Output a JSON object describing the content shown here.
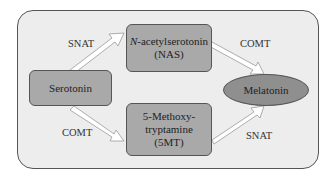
{
  "diagram": {
    "nodes": {
      "serotonin": {
        "label": "Serotonin"
      },
      "nas": {
        "label_italic": "N",
        "label_rest": "-acetylserotonin",
        "label_abbrev": "(NAS)"
      },
      "fivemt": {
        "line1": "5-Methoxy-",
        "line2": "tryptamine",
        "line3": "(5MT)"
      },
      "melatonin": {
        "label": "Melatonin"
      }
    },
    "edges": [
      {
        "from": "Serotonin",
        "to": "N-acetylserotonin (NAS)",
        "enzyme": "SNAT"
      },
      {
        "from": "N-acetylserotonin (NAS)",
        "to": "Melatonin",
        "enzyme": "COMT"
      },
      {
        "from": "Serotonin",
        "to": "5-Methoxytryptamine (5MT)",
        "enzyme": "COMT"
      },
      {
        "from": "5-Methoxytryptamine (5MT)",
        "to": "Melatonin",
        "enzyme": "SNAT"
      }
    ],
    "colors": {
      "frame_bg": "#ededed",
      "node_fill": "#a9a9a9",
      "ellipse_fill": "#8f8f8f",
      "border": "#555555",
      "arrow_fill": "#ffffff"
    }
  }
}
